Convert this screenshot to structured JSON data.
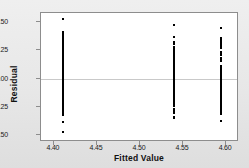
{
  "chart_data": {
    "type": "scatter",
    "title": "",
    "xlabel": "Fitted Value",
    "ylabel": "Residual",
    "xlim": [
      4.385,
      4.615
    ],
    "ylim": [
      -0.56,
      0.58
    ],
    "xticks": [
      "4.40",
      "4.45",
      "4.50",
      "4.55",
      "4.60"
    ],
    "xtick_values": [
      4.4,
      4.45,
      4.5,
      4.55,
      4.6
    ],
    "yticks": [
      "0.50",
      "0.25",
      "0.00",
      "-0.25",
      "-0.50"
    ],
    "ytick_values": [
      0.5,
      0.25,
      0.0,
      -0.25,
      -0.5
    ],
    "grid": false,
    "legend": null,
    "reference_line": {
      "axis": "y",
      "value": 0.0,
      "color": "#c9c9c9"
    },
    "marker": {
      "shape": "square",
      "size_px": 2,
      "color": "#000000"
    },
    "series": [
      {
        "name": "Group 1",
        "x_value": 4.411,
        "values": [
          0.53,
          0.41,
          0.4,
          0.39,
          0.38,
          0.36,
          0.35,
          0.34,
          0.33,
          0.32,
          0.305,
          0.3,
          0.295,
          0.285,
          0.28,
          0.275,
          0.27,
          0.265,
          0.26,
          0.255,
          0.25,
          0.245,
          0.24,
          0.235,
          0.23,
          0.225,
          0.22,
          0.215,
          0.21,
          0.205,
          0.2,
          0.195,
          0.19,
          0.185,
          0.18,
          0.175,
          0.17,
          0.165,
          0.16,
          0.155,
          0.15,
          0.145,
          0.14,
          0.135,
          0.13,
          0.125,
          0.12,
          0.115,
          0.11,
          0.105,
          0.1,
          0.095,
          0.09,
          0.085,
          0.08,
          0.075,
          0.07,
          0.06,
          0.05,
          0.045,
          0.04,
          0.035,
          0.03,
          0.025,
          0.02,
          0.015,
          0.01,
          0.005,
          0.0,
          -0.005,
          -0.01,
          -0.015,
          -0.02,
          -0.025,
          -0.03,
          -0.035,
          -0.04,
          -0.045,
          -0.05,
          -0.055,
          -0.06,
          -0.065,
          -0.07,
          -0.075,
          -0.08,
          -0.085,
          -0.09,
          -0.095,
          -0.1,
          -0.105,
          -0.11,
          -0.115,
          -0.12,
          -0.125,
          -0.13,
          -0.135,
          -0.14,
          -0.145,
          -0.15,
          -0.155,
          -0.16,
          -0.165,
          -0.17,
          -0.175,
          -0.18,
          -0.185,
          -0.19,
          -0.195,
          -0.2,
          -0.205,
          -0.21,
          -0.215,
          -0.22,
          -0.225,
          -0.23,
          -0.235,
          -0.24,
          -0.245,
          -0.25,
          -0.255,
          -0.26,
          -0.265,
          -0.27,
          -0.275,
          -0.285,
          -0.3,
          -0.31,
          -0.325,
          -0.385,
          -0.475
        ]
      },
      {
        "name": "Group 2",
        "x_value": 4.539,
        "values": [
          0.475,
          0.365,
          0.32,
          0.305,
          0.28,
          0.27,
          0.26,
          0.25,
          0.245,
          0.235,
          0.225,
          0.215,
          0.205,
          0.195,
          0.19,
          0.18,
          0.175,
          0.17,
          0.165,
          0.155,
          0.15,
          0.145,
          0.14,
          0.135,
          0.13,
          0.125,
          0.12,
          0.115,
          0.11,
          0.105,
          0.1,
          0.095,
          0.09,
          0.085,
          0.08,
          0.075,
          0.07,
          0.065,
          0.06,
          0.055,
          0.05,
          0.045,
          0.04,
          0.035,
          0.03,
          0.025,
          0.02,
          0.015,
          0.01,
          0.005,
          0.0,
          -0.005,
          -0.01,
          -0.015,
          -0.02,
          -0.025,
          -0.03,
          -0.035,
          -0.04,
          -0.045,
          -0.05,
          -0.055,
          -0.06,
          -0.065,
          -0.07,
          -0.075,
          -0.08,
          -0.085,
          -0.09,
          -0.095,
          -0.1,
          -0.105,
          -0.115,
          -0.12,
          -0.13,
          -0.14,
          -0.15,
          -0.165,
          -0.18,
          -0.195,
          -0.21,
          -0.225,
          -0.245,
          -0.265,
          -0.285,
          -0.305,
          -0.335,
          -0.345
        ]
      },
      {
        "name": "Group 3",
        "x_value": 4.594,
        "values": [
          0.445,
          0.36,
          0.345,
          0.33,
          0.315,
          0.3,
          0.285,
          0.27,
          0.235,
          0.225,
          0.215,
          0.205,
          0.185,
          0.175,
          0.165,
          0.155,
          0.115,
          0.105,
          0.095,
          0.085,
          0.075,
          0.065,
          0.055,
          0.045,
          0.035,
          0.025,
          0.015,
          0.005,
          -0.005,
          -0.015,
          -0.025,
          -0.035,
          -0.045,
          -0.055,
          -0.065,
          -0.075,
          -0.085,
          -0.095,
          -0.105,
          -0.115,
          -0.125,
          -0.135,
          -0.145,
          -0.155,
          -0.165,
          -0.175,
          -0.19,
          -0.205,
          -0.22,
          -0.235,
          -0.25,
          -0.265,
          -0.28,
          -0.295,
          -0.315,
          -0.375
        ]
      }
    ]
  }
}
